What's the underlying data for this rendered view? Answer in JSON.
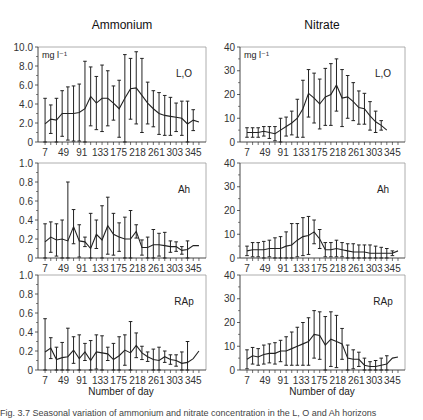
{
  "titles": {
    "left": "Ammonium",
    "right": "Nitrate"
  },
  "xlabel": "Number of day",
  "caption": "Fig. 3.7 Seasonal variation of ammonium and nitrate concentration in the L, O and Ah horizons",
  "chart_data": [
    {
      "type": "line",
      "title": "Ammonium",
      "panel_label": "L,O",
      "unit_label": "mg l⁻¹",
      "xlabel": "",
      "ylabel": "mg l-1",
      "ylim": [
        0,
        10
      ],
      "yticks": [
        "0",
        "2.0",
        "4.0",
        "6.0",
        "8.0",
        "10.0"
      ],
      "xticks": [
        7,
        49,
        91,
        133,
        175,
        218,
        261,
        303,
        345
      ],
      "x": [
        7,
        20,
        33,
        46,
        59,
        72,
        85,
        98,
        111,
        124,
        137,
        150,
        163,
        176,
        189,
        202,
        215,
        228,
        241,
        254,
        267,
        280,
        293,
        306,
        319,
        332,
        345,
        358
      ],
      "values": [
        1.9,
        2.4,
        2.3,
        3.0,
        3.0,
        3.0,
        3.1,
        3.5,
        4.8,
        4.1,
        4.6,
        4.6,
        4.1,
        3.5,
        4.6,
        5.6,
        5.7,
        4.9,
        4.1,
        3.5,
        3.0,
        2.8,
        2.7,
        2.6,
        2.5,
        1.9,
        2.3,
        2.1
      ],
      "err": [
        2.7,
        1.5,
        2.3,
        2.4,
        2.8,
        2.9,
        3.0,
        5.0,
        3.1,
        2.8,
        3.5,
        2.9,
        1.8,
        3.0,
        4.6,
        3.2,
        3.8,
        3.9,
        2.2,
        1.9,
        2.2,
        2.1,
        2.0,
        1.5,
        1.8,
        2.4,
        1.1,
        0
      ]
    },
    {
      "type": "line",
      "title": "Nitrate",
      "panel_label": "L,O",
      "unit_label": "mg l⁻¹",
      "ylim": [
        0,
        40
      ],
      "yticks": [
        "0",
        "10",
        "20",
        "30",
        "40"
      ],
      "xticks": [
        7,
        49,
        91,
        133,
        175,
        218,
        261,
        303,
        345
      ],
      "x": [
        7,
        20,
        33,
        46,
        59,
        72,
        85,
        98,
        111,
        124,
        137,
        150,
        163,
        176,
        189,
        202,
        215,
        228,
        241,
        254,
        267,
        280,
        293,
        306,
        319,
        332,
        345,
        358
      ],
      "values": [
        4,
        4,
        4,
        4.5,
        4,
        3.5,
        5,
        6.5,
        8,
        10,
        14,
        20.5,
        18.5,
        16,
        19,
        20,
        24,
        18.5,
        19,
        17,
        14.5,
        14,
        11,
        8.5,
        7,
        5,
        0,
        0
      ],
      "err": [
        2,
        2,
        2,
        2,
        2.5,
        3,
        5,
        4,
        5,
        8,
        12,
        10,
        10.5,
        10.5,
        12,
        13,
        11,
        12,
        9,
        8,
        7,
        6.5,
        6,
        4.5,
        2,
        0,
        0,
        0
      ]
    },
    {
      "type": "line",
      "title": "Ammonium",
      "panel_label": "Ah",
      "ylim": [
        0,
        1.0
      ],
      "yticks": [
        "0",
        "0.2",
        "0.4",
        "0.6",
        "0.8",
        "1.0"
      ],
      "xticks": [
        7,
        49,
        91,
        133,
        175,
        218,
        261,
        303,
        345
      ],
      "x": [
        7,
        20,
        33,
        46,
        59,
        72,
        85,
        98,
        111,
        124,
        137,
        150,
        163,
        176,
        189,
        202,
        215,
        228,
        241,
        254,
        267,
        280,
        293,
        306,
        319,
        332,
        345,
        358
      ],
      "values": [
        0.17,
        0.22,
        0.19,
        0.2,
        0.18,
        0.33,
        0.18,
        0.17,
        0.1,
        0.25,
        0.19,
        0.34,
        0.25,
        0.22,
        0.2,
        0.2,
        0.28,
        0.11,
        0.11,
        0.14,
        0.14,
        0.13,
        0.12,
        0.12,
        0.08,
        0.09,
        0.13,
        0.13
      ],
      "err": [
        0.19,
        0.16,
        0.17,
        0.2,
        0.62,
        0.18,
        0.17,
        0.05,
        0.37,
        0.15,
        0.36,
        0.3,
        0.22,
        0.15,
        0.23,
        0.3,
        0.07,
        0.08,
        0.11,
        0.16,
        0.12,
        0.14,
        0.06,
        0.05,
        0.04,
        0.09,
        0,
        0
      ]
    },
    {
      "type": "line",
      "title": "Nitrate",
      "panel_label": "Ah",
      "ylim": [
        0,
        40
      ],
      "yticks": [
        "0",
        "10",
        "20",
        "30",
        "40"
      ],
      "xticks": [
        7,
        49,
        91,
        133,
        175,
        218,
        261,
        303,
        345
      ],
      "x": [
        7,
        20,
        33,
        46,
        59,
        72,
        85,
        98,
        111,
        124,
        137,
        150,
        163,
        176,
        189,
        202,
        215,
        228,
        241,
        254,
        267,
        280,
        293,
        306,
        319,
        332,
        345,
        358
      ],
      "values": [
        3,
        3.5,
        3.5,
        3.5,
        4,
        4,
        4,
        5,
        5.5,
        7.5,
        9,
        9.5,
        11,
        8,
        3.5,
        3.5,
        4,
        3.5,
        3,
        2.5,
        2.5,
        2.5,
        2,
        2,
        2,
        2,
        2,
        3
      ],
      "err": [
        2,
        3,
        3,
        3.5,
        3.5,
        4.5,
        5,
        6,
        9,
        7,
        8,
        8,
        5,
        4,
        3,
        3,
        3.5,
        3,
        3,
        3.5,
        3,
        3,
        3.5,
        3,
        2.5,
        2,
        1,
        0
      ]
    },
    {
      "type": "line",
      "title": "Ammonium",
      "panel_label": "RAp",
      "ylim": [
        0,
        1.0
      ],
      "yticks": [
        "0",
        "0.2",
        "0.4",
        "0.6",
        "0.8",
        "1.0"
      ],
      "xticks": [
        7,
        49,
        91,
        133,
        175,
        218,
        261,
        303,
        345
      ],
      "x": [
        7,
        20,
        33,
        46,
        59,
        72,
        85,
        98,
        111,
        124,
        137,
        150,
        163,
        176,
        189,
        202,
        215,
        228,
        241,
        254,
        267,
        280,
        293,
        306,
        319,
        332,
        345,
        358
      ],
      "values": [
        0.19,
        0.23,
        0.11,
        0.13,
        0.14,
        0.21,
        0.12,
        0.19,
        0.1,
        0.19,
        0.18,
        0.17,
        0.11,
        0.15,
        0.21,
        0.18,
        0.26,
        0.18,
        0.14,
        0.11,
        0.1,
        0.14,
        0.11,
        0.1,
        0.07,
        0.08,
        0.12,
        0.2
      ],
      "err": [
        0.35,
        0.11,
        0.13,
        0.16,
        0.3,
        0.14,
        0.25,
        0.09,
        0.21,
        0.18,
        0.18,
        0.07,
        0.17,
        0.2,
        0.16,
        0.33,
        0.13,
        0.07,
        0.05,
        0.11,
        0.14,
        0.06,
        0.05,
        0.06,
        0.12,
        0.22,
        0,
        0
      ]
    },
    {
      "type": "line",
      "title": "Nitrate",
      "panel_label": "RAp",
      "ylim": [
        0,
        40
      ],
      "yticks": [
        "0",
        "10",
        "20",
        "30",
        "40"
      ],
      "xticks": [
        7,
        49,
        91,
        133,
        175,
        218,
        261,
        303,
        345
      ],
      "x": [
        7,
        20,
        33,
        46,
        59,
        72,
        85,
        98,
        111,
        124,
        137,
        150,
        163,
        176,
        189,
        202,
        215,
        228,
        241,
        254,
        267,
        280,
        293,
        306,
        319,
        332,
        345,
        358
      ],
      "values": [
        4.5,
        6,
        5.5,
        6.5,
        7,
        7,
        8,
        8,
        9,
        10,
        11,
        12,
        15,
        14.5,
        10.5,
        13,
        12,
        11,
        5,
        4.5,
        4.5,
        2,
        1.5,
        1.5,
        2,
        2.5,
        5,
        5.5
      ],
      "err": [
        4,
        3.5,
        3.5,
        4,
        4,
        4.5,
        4.5,
        6,
        7,
        8,
        9,
        10,
        10,
        10,
        12,
        11.5,
        11,
        6.5,
        5.5,
        4,
        3,
        3,
        2,
        2.5,
        3,
        3.5,
        0,
        0
      ]
    }
  ]
}
